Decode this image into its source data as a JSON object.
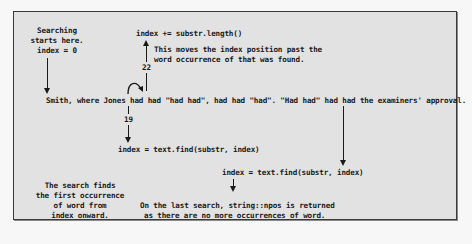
{
  "diagram": {
    "start_note": [
      "Searching",
      "starts here.",
      "index = 0"
    ],
    "increment_code": "index += substr.length()",
    "increment_note": [
      "This moves the index position past the",
      "word occurrence of that was found."
    ],
    "label_22": "22",
    "label_19": "19",
    "sentence": "Smith, where Jones had had \"had had\", had had \"had\". \"Had had\" had had the examiners' approval.",
    "find_call_1": "index = text.find(substr, index)",
    "find_call_2": "index = text.find(substr, index)",
    "search_note": [
      "The search finds",
      "the first occurrence",
      "of word from",
      "index onward."
    ],
    "npos_note": [
      "On the last search, string::npos is returned",
      "as there are no more occurrences of word."
    ]
  }
}
